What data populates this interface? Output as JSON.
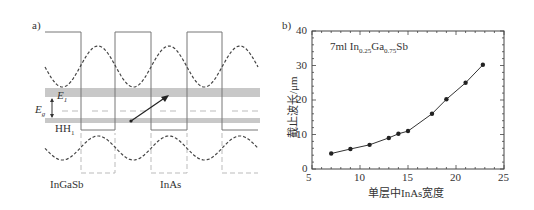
{
  "panel_a": {
    "label": "a)",
    "e1_label": "E",
    "e1_sub": "1",
    "eg_label": "E",
    "eg_sub": "g",
    "hh1_label": "HH",
    "hh1_sub": "1",
    "material_left": "InGaSb",
    "material_right": "InAs",
    "colors": {
      "band_fill": "#c8c8c8",
      "line": "#555555",
      "dashed_gray": "#aaaaaa"
    }
  },
  "panel_b": {
    "label": "b)",
    "annotation": {
      "prefix": "7ml In",
      "sub1": "0.25",
      "mid": "Ga",
      "sub2": "0.75",
      "suffix": "Sb"
    },
    "xlabel": "单层中InAs宽度",
    "ylabel": "截止波长/μm",
    "xticks": [
      "5",
      "10",
      "15",
      "20",
      "25"
    ],
    "yticks": [
      "0",
      "10",
      "20",
      "30",
      "40"
    ]
  },
  "chart_data": {
    "type": "line",
    "title": "",
    "annotation": "7ml In0.25Ga0.75Sb",
    "xlabel": "单层中InAs宽度",
    "ylabel": "截止波长/μm",
    "xlim": [
      5,
      25
    ],
    "ylim": [
      0,
      40
    ],
    "grid": false,
    "x": [
      7,
      9,
      11,
      13,
      14,
      15,
      17.5,
      19,
      21,
      22.8
    ],
    "series": [
      {
        "name": "cutoff wavelength",
        "values": [
          4.5,
          5.8,
          7.0,
          9.0,
          10.2,
          11.0,
          16.0,
          20.2,
          25.0,
          30.2
        ]
      }
    ]
  }
}
